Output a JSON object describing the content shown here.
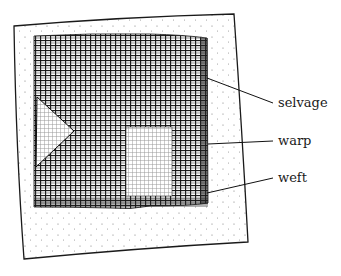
{
  "figure": {
    "labels": {
      "selvage": "selvage",
      "warp": "warp",
      "weft": "weft"
    },
    "colors": {
      "ink": "#1a1a1a",
      "paper": "#ffffff",
      "dots": "#777777"
    }
  }
}
